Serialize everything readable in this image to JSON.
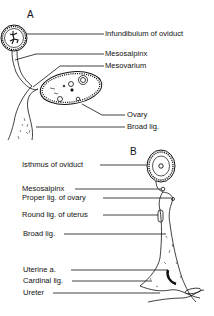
{
  "figure": {
    "panels": [
      {
        "id": "A",
        "label": "A",
        "labels": [
          {
            "key": "infundibulum",
            "text": "Infundibulum of oviduct"
          },
          {
            "key": "mesosalpinx",
            "text": "Mesosalpinx"
          },
          {
            "key": "mesovarium",
            "text": "Mesovarium"
          },
          {
            "key": "ovary",
            "text": "Ovary"
          },
          {
            "key": "broad_lig",
            "text": "Broad lig."
          }
        ]
      },
      {
        "id": "B",
        "label": "B",
        "labels": [
          {
            "key": "isthmus",
            "text": "Isthmus of oviduct"
          },
          {
            "key": "mesosalpinx",
            "text": "Mesosalpinx"
          },
          {
            "key": "proper_lig_ovary",
            "text": "Proper lig. of ovary"
          },
          {
            "key": "round_lig_uterus",
            "text": "Round lig. of uterus"
          },
          {
            "key": "broad_lig",
            "text": "Broad lig."
          },
          {
            "key": "uterine_a",
            "text": "Uterine a."
          },
          {
            "key": "cardinal_lig",
            "text": "Cardinal lig."
          },
          {
            "key": "ureter",
            "text": "Ureter"
          }
        ]
      }
    ],
    "colors": {
      "ink": "#111111",
      "background": "#ffffff"
    }
  }
}
